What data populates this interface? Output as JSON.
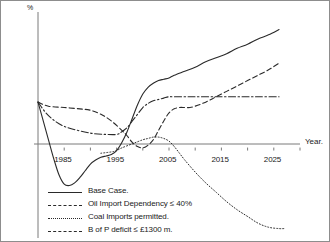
{
  "chart_data": {
    "type": "line",
    "title": "",
    "xlabel": "Year.",
    "ylabel": "%",
    "xlim": [
      1980,
      2030
    ],
    "ylim": [
      -65,
      103
    ],
    "grid": false,
    "legend_position": "bottom-left",
    "xticks": [
      "1985",
      "1995",
      "2005",
      "2015",
      "2025"
    ],
    "xtick_values": [
      1985,
      1995,
      2005,
      2015,
      2025
    ],
    "xtick_minor_values": [
      1990,
      2000,
      2010,
      2020,
      2030
    ],
    "yticks": [
      "100",
      "90",
      "80",
      "70",
      "60",
      "50",
      "40",
      "30",
      "20",
      "10",
      "0",
      "-10",
      "-20",
      "-30",
      "-40",
      "-50",
      "-60"
    ],
    "ytick_values": [
      100,
      90,
      80,
      70,
      60,
      50,
      40,
      30,
      20,
      10,
      0,
      -10,
      -20,
      -30,
      -40,
      -50,
      -60
    ],
    "series": [
      {
        "name": "Base Case.",
        "style": "solid",
        "color": "#2a2a2a",
        "x": [
          1980,
          1981,
          1982,
          1983,
          1984,
          1985,
          1986,
          1987,
          1988,
          1989,
          1990,
          1991,
          1992,
          1993,
          1994,
          1995,
          1996,
          1997,
          1998,
          1999,
          2000,
          2001,
          2002,
          2003,
          2004,
          2005,
          2006,
          2008,
          2010,
          2012,
          2014,
          2016,
          2018,
          2020,
          2022,
          2024,
          2026
        ],
        "y": [
          36,
          22,
          8,
          -6,
          -18,
          -25,
          -26,
          -24,
          -20,
          -15,
          -10,
          -7,
          -5,
          -4,
          -3,
          0,
          6,
          14,
          24,
          34,
          42,
          47,
          50,
          52,
          53,
          54,
          56,
          59,
          62,
          66,
          69,
          72,
          76,
          79,
          83,
          86,
          90
        ]
      },
      {
        "name": "Oil Import Dependency ≤ 40%",
        "style": "dashdot",
        "color": "#2a2a2a",
        "x": [
          1980,
          1982,
          1985,
          1990,
          1993,
          1995,
          1996,
          1997,
          1998,
          1999,
          2000,
          2001,
          2002,
          2003,
          2004,
          2005,
          2006,
          2008,
          2010,
          2014,
          2018,
          2022,
          2026
        ],
        "y": [
          36,
          26,
          18,
          13,
          12,
          12,
          14,
          17,
          22,
          27,
          32,
          35,
          37,
          38,
          39,
          40,
          40,
          40,
          40,
          40,
          40,
          40,
          40
        ]
      },
      {
        "name": "Coal Imports permitted.",
        "style": "dotted",
        "color": "#2a2a2a",
        "x": [
          1992,
          1994,
          1995,
          1996,
          1998,
          2000,
          2001,
          2002,
          2003,
          2004,
          2005,
          2006,
          2007,
          2008,
          2010,
          2012,
          2014,
          2016,
          2018,
          2020,
          2022,
          2024,
          2026,
          2027
        ],
        "y": [
          -2,
          -1,
          0,
          2,
          5,
          8,
          9,
          10,
          10,
          9,
          7,
          3,
          -2,
          -7,
          -16,
          -24,
          -31,
          -38,
          -44,
          -49,
          -54,
          -57,
          -58,
          -58
        ]
      },
      {
        "name": "B of P deficit ≤ £1300 m.",
        "style": "dashed",
        "color": "#2a2a2a",
        "x": [
          1980,
          1982,
          1985,
          1988,
          1990,
          1992,
          1994,
          1996,
          1997,
          1998,
          1999,
          2000,
          2001,
          2002,
          2003,
          2004,
          2005,
          2006,
          2007,
          2008,
          2009,
          2010,
          2012,
          2014,
          2016,
          2018,
          2020,
          2022,
          2024,
          2026
        ],
        "y": [
          36,
          33,
          32,
          31,
          30,
          27,
          22,
          15,
          11,
          6,
          3,
          2,
          4,
          8,
          15,
          22,
          28,
          31,
          32,
          32,
          32,
          33,
          36,
          40,
          44,
          48,
          52,
          56,
          60,
          65
        ]
      }
    ]
  },
  "legend": {
    "entries": [
      {
        "label": "Base Case.",
        "style": "solid"
      },
      {
        "label": "Oil Import Dependency ≤ 40%",
        "style": "dashdot"
      },
      {
        "label": "Coal Imports permitted.",
        "style": "dotted"
      },
      {
        "label": "B of P deficit ≤ £1300 m.",
        "style": "dashed"
      }
    ]
  }
}
